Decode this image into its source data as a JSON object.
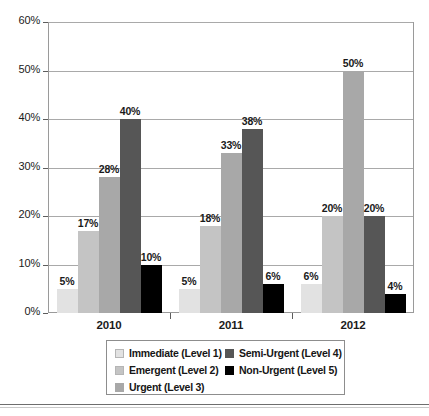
{
  "chart_data": {
    "type": "bar",
    "title": "",
    "xlabel": "",
    "ylabel": "",
    "categories": [
      "2010",
      "2011",
      "2012"
    ],
    "ylim": [
      0,
      60
    ],
    "ytick_labels": [
      "0%",
      "10%",
      "20%",
      "30%",
      "40%",
      "50%",
      "60%"
    ],
    "ytick_values": [
      0,
      10,
      20,
      30,
      40,
      50,
      60
    ],
    "grid": true,
    "legend_position": "bottom",
    "value_suffix": "%",
    "series": [
      {
        "name": "Immediate (Level 1)",
        "color": "#e2e2e2",
        "values": [
          5,
          5,
          6
        ],
        "labels": [
          "5%",
          "5%",
          "6%"
        ]
      },
      {
        "name": "Emergent (Level 2)",
        "color": "#c4c4c4",
        "values": [
          17,
          18,
          20
        ],
        "labels": [
          "17%",
          "18%",
          "20%"
        ]
      },
      {
        "name": "Urgent (Level 3)",
        "color": "#a8a8a8",
        "values": [
          28,
          33,
          50
        ],
        "labels": [
          "28%",
          "33%",
          "50%"
        ]
      },
      {
        "name": "Semi-Urgent (Level 4)",
        "color": "#565656",
        "values": [
          40,
          38,
          20
        ],
        "labels": [
          "40%",
          "38%",
          "20%"
        ]
      },
      {
        "name": "Non-Urgent (Level 5)",
        "color": "#000000",
        "values": [
          10,
          6,
          4
        ],
        "labels": [
          "10%",
          "6%",
          "4%"
        ]
      }
    ]
  },
  "axis": {
    "y_labels": [
      "60%",
      "50%",
      "40%",
      "30%",
      "20%",
      "10%",
      "0%"
    ],
    "x_labels": [
      "2010",
      "2011",
      "2012"
    ]
  },
  "legend": {
    "left_column": [
      {
        "label": "Immediate (Level 1)",
        "color": "#e2e2e2"
      },
      {
        "label": "Emergent (Level 2)",
        "color": "#c4c4c4"
      },
      {
        "label": "Urgent (Level 3)",
        "color": "#a8a8a8"
      }
    ],
    "right_column": [
      {
        "label": "Semi-Urgent (Level 4)",
        "color": "#565656"
      },
      {
        "label": "Non-Urgent (Level 5)",
        "color": "#000000"
      }
    ]
  }
}
